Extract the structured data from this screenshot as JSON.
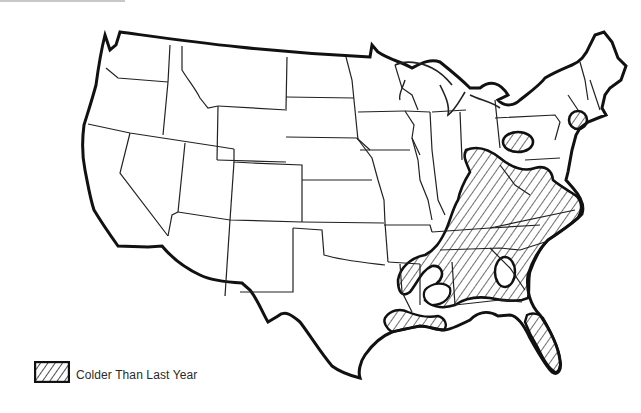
{
  "map": {
    "title": "",
    "region": "Contiguous United States",
    "colors": {
      "background": "#ffffff",
      "outline": "#111111",
      "state_border": "#222222",
      "hatch": "#222222"
    },
    "shaded_regions": [
      {
        "name": "Southeast / Ohio Valley region",
        "pattern": "diagonal-hatch",
        "category": "Colder Than Last Year"
      },
      {
        "name": "Gulf Coast (Louisiana / Texas coast)",
        "pattern": "diagonal-hatch",
        "category": "Colder Than Last Year"
      },
      {
        "name": "Florida peninsula",
        "pattern": "diagonal-hatch",
        "category": "Colder Than Last Year"
      },
      {
        "name": "Western New York / Pennsylvania oval",
        "pattern": "diagonal-hatch",
        "category": "Colder Than Last Year"
      },
      {
        "name": "Southern New England circle",
        "pattern": "diagonal-hatch",
        "category": "Colder Than Last Year"
      }
    ],
    "excluded_pockets": [
      {
        "name": "Oval in Georgia/South Carolina",
        "pattern": "none"
      },
      {
        "name": "Pocket in southern Mississippi/Louisiana",
        "pattern": "none"
      }
    ]
  },
  "legend": {
    "items": [
      {
        "pattern": "diagonal-hatch",
        "label": "Colder Than Last Year"
      }
    ]
  }
}
